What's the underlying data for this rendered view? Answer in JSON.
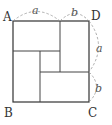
{
  "diagram": {
    "type": "square-dissection",
    "vertices": {
      "top_left": "A",
      "bottom_left": "B",
      "bottom_right": "C",
      "top_right": "D"
    },
    "segment_labels": {
      "top_left_segment": "a",
      "top_right_segment": "b",
      "right_upper_segment": "a",
      "right_lower_segment": "b"
    }
  }
}
